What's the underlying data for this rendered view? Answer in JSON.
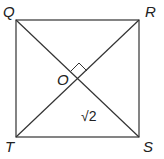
{
  "diagram": {
    "type": "square-with-diagonals",
    "vertices": {
      "Q": {
        "label": "Q",
        "x": 16,
        "y": 20
      },
      "R": {
        "label": "R",
        "x": 139,
        "y": 20
      },
      "S": {
        "label": "S",
        "x": 139,
        "y": 137
      },
      "T": {
        "label": "T",
        "x": 16,
        "y": 137
      }
    },
    "center": {
      "label": "O",
      "x": 79,
      "y": 79
    },
    "right_angle_marker": true,
    "segment_label": {
      "text": "√2",
      "segment": "OS"
    },
    "stroke_color": "#333333"
  }
}
